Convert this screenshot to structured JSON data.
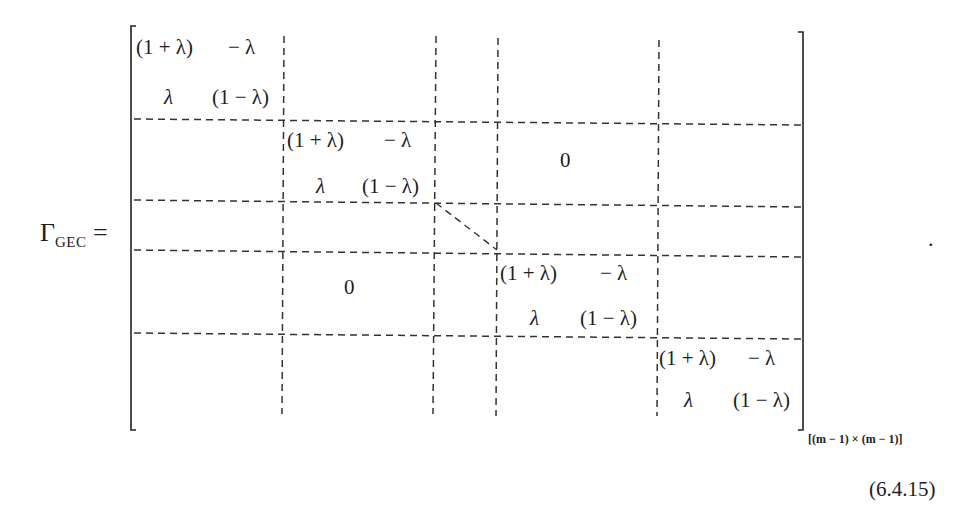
{
  "equation": {
    "lhs_symbol": "Γ",
    "lhs_subscript": "GEC",
    "equals": "=",
    "block": {
      "r1c1": "(1 + λ)",
      "r1c2": "− λ",
      "r2c1": "λ",
      "r2c2": "(1 − λ)"
    },
    "zero": "0",
    "dimension": "[(m − 1) × (m − 1)]",
    "trailing_punct": ".",
    "number": "(6.4.15)"
  },
  "colors": {
    "ink": "#1e1e1e",
    "dash": "#333333",
    "background": "#ffffff"
  }
}
